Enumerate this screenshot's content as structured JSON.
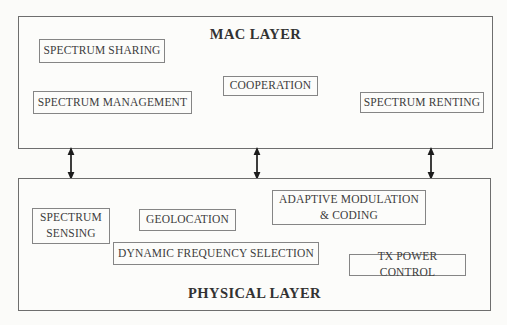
{
  "diagram_title": "Cognitive radio protocol stack: MAC and Physical layer functions",
  "mac_layer": {
    "title": "MAC LAYER",
    "boxes": {
      "spectrum_sharing": "SPECTRUM SHARING",
      "spectrum_management": "SPECTRUM MANAGEMENT",
      "cooperation": "COOPERATION",
      "spectrum_renting": "SPECTRUM RENTING"
    }
  },
  "physical_layer": {
    "title": "PHYSICAL LAYER",
    "boxes": {
      "spectrum_sensing": "SPECTRUM\nSENSING",
      "geolocation": "GEOLOCATION",
      "adaptive_modulation_coding": "ADAPTIVE MODULATION\n& CODING",
      "dynamic_frequency_selection": "DYNAMIC FREQUENCY SELECTION",
      "tx_power_control": "TX POWER CONTROL"
    }
  },
  "connectors": {
    "type": "vertical-double-headed-arrow",
    "count": 3,
    "meaning": "bidirectional interaction between MAC layer and Physical layer"
  },
  "colors": {
    "background": "#fbfbf9",
    "outer_border": "#6e6e6e",
    "inner_border": "#858585",
    "text": "#3d3d3d",
    "title_text": "#323232",
    "arrow": "#1c1c1c"
  }
}
